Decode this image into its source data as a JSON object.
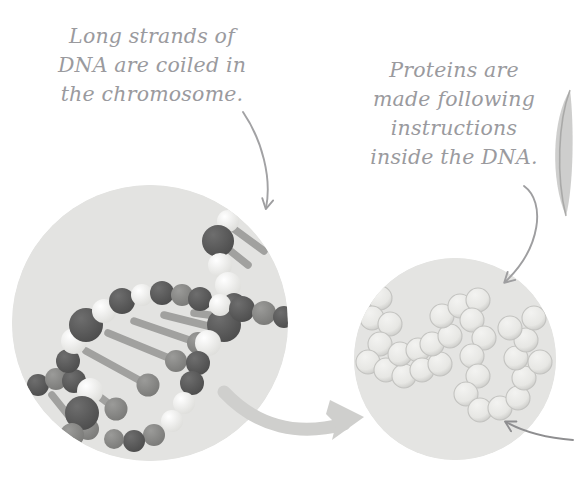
{
  "figure": {
    "kind": "biology-illustration",
    "background_color": "#ffffff"
  },
  "annotations": {
    "chromosome": {
      "text": "Long strands of\nDNA are coiled in\nthe chromosome.",
      "color": "#9a9a9e"
    },
    "proteins": {
      "text": "Proteins are\nmade following\ninstructions\ninside the DNA.",
      "color": "#9a9a9e"
    }
  },
  "circles": {
    "dna": {
      "label": "dna-double-helix-circle",
      "fill_color": "#e3e3e1",
      "sphere_dark_color": "#595959",
      "sphere_light_color": "#f2f2ef",
      "rung_color": "#9d9d9b"
    },
    "protein": {
      "label": "protein-chain-circle",
      "fill_color": "#e4e4e2",
      "sphere_color": "#e9e9e6",
      "sphere_shade_color": "#bcbcba"
    }
  },
  "connectors": {
    "thick_arrow": {
      "label": "dna-to-protein-arrow",
      "color": "#cfcfcd"
    },
    "pointer_chromosome": {
      "label": "chromosome-callout-arrow",
      "color": "#a2a2a4"
    },
    "pointer_protein": {
      "label": "protein-callout-arrow",
      "color": "#9e9ea0"
    },
    "pointer_bottom_right": {
      "label": "offscreen-callout-arrow",
      "color": "#8e8e90"
    }
  },
  "edge_shape": {
    "label": "partial-cropped-shape",
    "color": "#b9b9b7"
  }
}
